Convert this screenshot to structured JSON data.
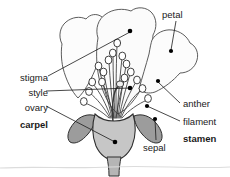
{
  "diagram": {
    "background_color": "#ffffff",
    "line_color": "#231f20",
    "petal_fill": "#fbfbfb",
    "sepal_fill": "#9a9a9a",
    "receptacle_fill": "#c9c9c9",
    "ovary_fill": "#e8e8e8",
    "anther_fill": "#ffffff",
    "leader_color": "#1a1a1a",
    "dot_color": "#000000"
  },
  "labels": {
    "petal": "petal",
    "stigma": "stigma",
    "style": "style",
    "ovary": "ovary",
    "carpel": "carpel",
    "anther": "anther",
    "filament": "filament",
    "stamen": "stamen",
    "sepal": "sepal"
  },
  "parts": [
    {
      "name": "petal",
      "label": "petal",
      "side": "right",
      "bold": false,
      "group": null
    },
    {
      "name": "stigma",
      "label": "stigma",
      "side": "left",
      "bold": false,
      "group": "carpel"
    },
    {
      "name": "style",
      "label": "style",
      "side": "left",
      "bold": false,
      "group": "carpel"
    },
    {
      "name": "ovary",
      "label": "ovary",
      "side": "left",
      "bold": false,
      "group": "carpel"
    },
    {
      "name": "carpel",
      "label": "carpel",
      "side": "left",
      "bold": true,
      "group": null
    },
    {
      "name": "anther",
      "label": "anther",
      "side": "right",
      "bold": false,
      "group": "stamen"
    },
    {
      "name": "filament",
      "label": "filament",
      "side": "right",
      "bold": false,
      "group": "stamen"
    },
    {
      "name": "stamen",
      "label": "stamen",
      "side": "right",
      "bold": true,
      "group": null
    },
    {
      "name": "sepal",
      "label": "sepal",
      "side": "bottom",
      "bold": false,
      "group": null
    }
  ]
}
